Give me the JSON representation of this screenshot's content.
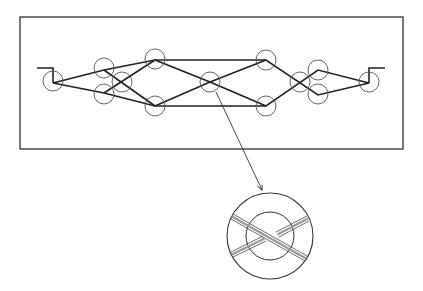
{
  "diagram": {
    "type": "interferometer-network-schematic",
    "colors": {
      "background": "#ffffff",
      "stroke": "#222222",
      "circle": "#555555"
    },
    "frame": {
      "x": 20,
      "y": 17,
      "width": 383,
      "height": 132
    },
    "ports": {
      "input_stub": [
        [
          37,
          68
        ],
        [
          53,
          68
        ],
        [
          53,
          83
        ]
      ],
      "output_stub": [
        [
          369,
          83
        ],
        [
          369,
          68
        ],
        [
          385,
          68
        ]
      ]
    },
    "nodes": [
      {
        "id": "n1",
        "cx": 53,
        "cy": 81,
        "r": 10
      },
      {
        "id": "n2",
        "cx": 104,
        "cy": 68,
        "r": 10
      },
      {
        "id": "n3",
        "cx": 104,
        "cy": 94,
        "r": 10
      },
      {
        "id": "n4",
        "cx": 122,
        "cy": 82,
        "r": 10
      },
      {
        "id": "n5",
        "cx": 155,
        "cy": 59,
        "r": 10
      },
      {
        "id": "n6",
        "cx": 155,
        "cy": 106,
        "r": 10
      },
      {
        "id": "n7",
        "cx": 210,
        "cy": 82,
        "r": 10
      },
      {
        "id": "n8",
        "cx": 266,
        "cy": 60,
        "r": 10
      },
      {
        "id": "n9",
        "cx": 266,
        "cy": 106,
        "r": 10
      },
      {
        "id": "n10",
        "cx": 300,
        "cy": 82,
        "r": 10
      },
      {
        "id": "n11",
        "cx": 318,
        "cy": 70,
        "r": 10
      },
      {
        "id": "n12",
        "cx": 318,
        "cy": 94,
        "r": 10
      },
      {
        "id": "n13",
        "cx": 369,
        "cy": 82,
        "r": 10
      }
    ],
    "paths": [
      [
        [
          53,
          83
        ],
        [
          104,
          70
        ],
        [
          155,
          60
        ],
        [
          266,
          60
        ],
        [
          318,
          95
        ],
        [
          369,
          83
        ]
      ],
      [
        [
          53,
          83
        ],
        [
          104,
          93
        ],
        [
          155,
          106
        ],
        [
          266,
          106
        ],
        [
          318,
          70
        ],
        [
          369,
          83
        ]
      ],
      [
        [
          104,
          70
        ],
        [
          155,
          106
        ]
      ],
      [
        [
          104,
          93
        ],
        [
          155,
          60
        ]
      ],
      [
        [
          155,
          60
        ],
        [
          210,
          82
        ],
        [
          266,
          106
        ]
      ],
      [
        [
          155,
          106
        ],
        [
          210,
          82
        ],
        [
          266,
          60
        ]
      ]
    ],
    "callout_arrow": {
      "from": [
        216,
        92
      ],
      "to": [
        262,
        190
      ]
    },
    "detail_view": {
      "cx": 270,
      "cy": 236,
      "outer_r": 43,
      "inner_r": 24,
      "label": "crossing detail"
    }
  }
}
